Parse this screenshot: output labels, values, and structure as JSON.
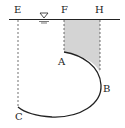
{
  "diagram": {
    "labels": {
      "E": "E",
      "F": "F",
      "H": "H",
      "A": "A",
      "B": "B",
      "C": "C"
    },
    "free_surface_symbol": "water-level-triangle",
    "colors": {
      "line": "#222222",
      "shade": "#d4d4d4",
      "background": "#ffffff"
    }
  }
}
